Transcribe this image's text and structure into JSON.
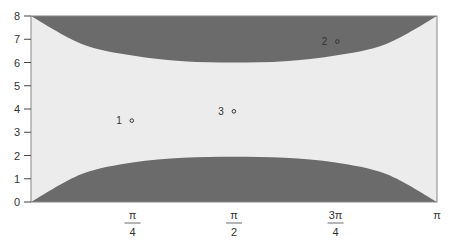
{
  "chart_data": {
    "type": "area",
    "title": "",
    "xlabel": "",
    "ylabel": "",
    "xlim": [
      0,
      3.14159
    ],
    "ylim": [
      0,
      8
    ],
    "grid": false,
    "legend": "none",
    "y_ticks": [
      "0",
      "1",
      "2",
      "3",
      "4",
      "5",
      "6",
      "7",
      "8"
    ],
    "x_ticks": [
      {
        "value": 0.7854,
        "num": "π",
        "den": "4"
      },
      {
        "value": 1.5708,
        "num": "π",
        "den": "2"
      },
      {
        "value": 2.3562,
        "num": "3π",
        "den": "4"
      },
      {
        "value": 3.1416,
        "num": "π",
        "den": ""
      }
    ],
    "regions": [
      {
        "name": "upper-shaded",
        "color": "#6b6b6b",
        "boundary_x": [
          0,
          0.3927,
          0.7854,
          1.1781,
          1.5708,
          1.9635,
          2.3562,
          2.7489,
          3.1416
        ],
        "boundary_y": [
          8.0,
          6.8,
          6.3,
          6.05,
          6.0,
          6.05,
          6.3,
          6.8,
          8.0
        ],
        "fill_to": 8
      },
      {
        "name": "lower-shaded",
        "color": "#6b6b6b",
        "boundary_x": [
          0,
          0.3927,
          0.7854,
          1.1781,
          1.5708,
          1.9635,
          2.3562,
          2.7489,
          3.1416
        ],
        "boundary_y": [
          0.0,
          1.2,
          1.7,
          1.9,
          1.95,
          1.9,
          1.7,
          1.2,
          0.0
        ],
        "fill_to": 0
      }
    ],
    "background_color": "#ececec",
    "points": [
      {
        "label": "1",
        "x": 0.78,
        "y": 3.5
      },
      {
        "label": "2",
        "x": 2.37,
        "y": 6.9
      },
      {
        "label": "3",
        "x": 1.57,
        "y": 3.9
      }
    ]
  }
}
